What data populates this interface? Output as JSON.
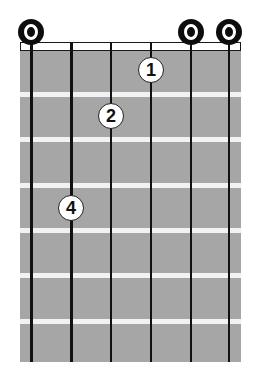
{
  "chord_diagram": {
    "strings": 6,
    "frets_shown": 7,
    "open_strings": [
      1,
      5,
      6
    ],
    "fingers": [
      {
        "finger": "1",
        "string": 4,
        "fret": 1
      },
      {
        "finger": "2",
        "string": 3,
        "fret": 2
      },
      {
        "finger": "4",
        "string": 2,
        "fret": 4
      }
    ],
    "open_marker": "O",
    "colors": {
      "board": "#a6a6a6",
      "fret": "#f2f2f2",
      "string": "#111111",
      "marker": "#0d0d0d"
    }
  }
}
